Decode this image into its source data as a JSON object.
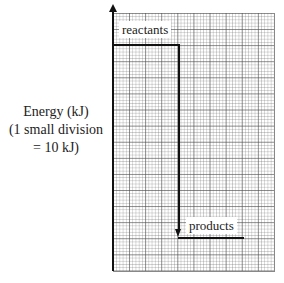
{
  "diagram": {
    "type": "energy-level-diagram",
    "y_axis_label": {
      "line1": "Energy (kJ)",
      "line2": "(1 small division",
      "line3": "= 10 kJ)"
    },
    "levels": [
      {
        "name": "reactants",
        "label": "reactants"
      },
      {
        "name": "products",
        "label": "products"
      }
    ],
    "grid": {
      "small_divisions_x": 50,
      "small_divisions_y": 80,
      "major_every": 5
    },
    "arrow": {
      "from": "reactants",
      "to": "products",
      "direction": "down"
    }
  }
}
